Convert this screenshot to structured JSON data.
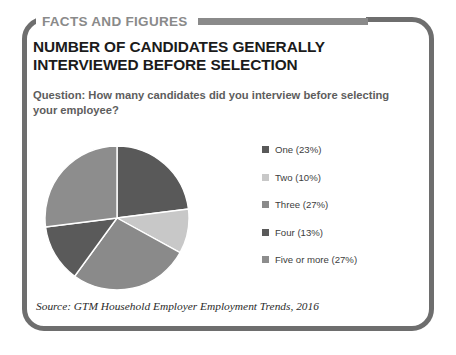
{
  "banner": {
    "title": "FACTS AND FIGURES"
  },
  "headline": "NUMBER OF CANDIDATES GENERALLY INTERVIEWED BEFORE SELECTION",
  "question": "Question: How many candidates did you interview before selecting your employee?",
  "source": "Source: GTM Household Employer Employment Trends, 2016",
  "colors": {
    "frame": "#6e6e6e",
    "banner": "#8a8a8a",
    "headline": "#1b1b1b",
    "question": "#5d5d5d"
  },
  "chart_data": {
    "type": "pie",
    "title": "NUMBER OF CANDIDATES GENERALLY INTERVIEWED BEFORE SELECTION",
    "subtitle": "Question: How many candidates did you interview before selecting your employee?",
    "legend_position": "right",
    "start_angle_deg": 0,
    "direction": "clockwise",
    "categories": [
      "One",
      "Two",
      "Three",
      "Four",
      "Five or more"
    ],
    "values": [
      23,
      10,
      27,
      13,
      27
    ],
    "value_unit": "%",
    "slice_colors": [
      "#595959",
      "#c8c8c8",
      "#8a8a8a",
      "#5a5a5a",
      "#8d8d8d"
    ],
    "labels": [
      "One (23%)",
      "Two (10%)",
      "Three (27%)",
      "Four (13%)",
      "Five or more (27%)"
    ],
    "legend": [
      {
        "label": "One (23%)",
        "color": "#595959"
      },
      {
        "label": "Two (10%)",
        "color": "#c8c8c8"
      },
      {
        "label": "Three (27%)",
        "color": "#8a8a8a"
      },
      {
        "label": "Four (13%)",
        "color": "#5a5a5a"
      },
      {
        "label": "Five or more (27%)",
        "color": "#8d8d8d"
      }
    ]
  }
}
